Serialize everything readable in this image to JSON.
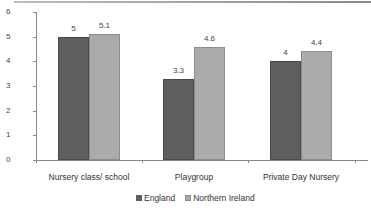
{
  "chart_data": {
    "type": "bar",
    "title": "",
    "xlabel": "",
    "ylabel": "",
    "categories": [
      "Nursery class/ school",
      "Playgroup",
      "Private Day Nursery"
    ],
    "series": [
      {
        "name": "England",
        "values": [
          5,
          3.3,
          4
        ],
        "color": "#5e5e5e"
      },
      {
        "name": "Northern Ireland",
        "values": [
          5.1,
          4.6,
          4.4
        ],
        "color": "#ababab"
      }
    ],
    "data_labels": {
      "England": [
        "5",
        "3.3",
        "4"
      ],
      "Northern Ireland": [
        "5.1",
        "4.6",
        "4.4"
      ]
    },
    "ylim": [
      0,
      6
    ],
    "yticks": [
      "0",
      "1",
      "2",
      "3",
      "4",
      "5",
      "6"
    ],
    "grid": false,
    "legend_position": "bottom"
  },
  "legend": {
    "items": [
      {
        "label": "England",
        "color": "#5e5e5e"
      },
      {
        "label": "Northern Ireland",
        "color": "#ababab"
      }
    ]
  }
}
